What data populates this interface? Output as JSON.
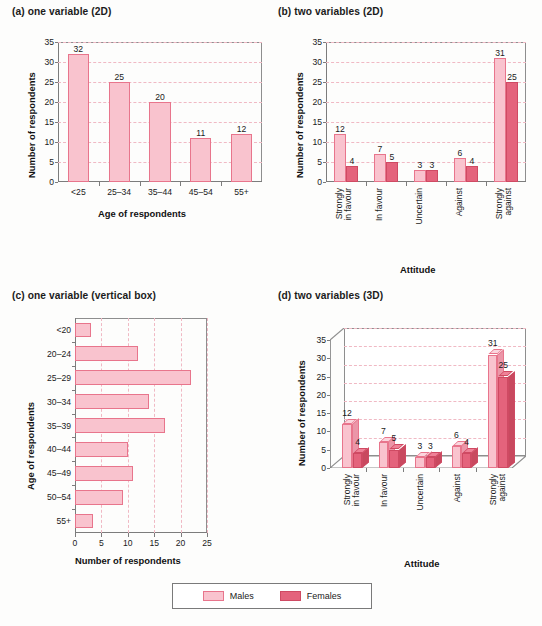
{
  "figure": {
    "panels": [
      {
        "key": "a",
        "title": "(a) one variable (2D)"
      },
      {
        "key": "b",
        "title": "(b) two variables (2D)"
      },
      {
        "key": "c",
        "title": "(c) one variable (vertical box)"
      },
      {
        "key": "d",
        "title": "(d) two variables (3D)"
      }
    ]
  },
  "legend": {
    "items": [
      {
        "label": "Males",
        "color": "#f9c3ce"
      },
      {
        "label": "Females",
        "color": "#e4637c"
      }
    ]
  },
  "colors": {
    "male_fill": "#f9c3ce",
    "male_stroke": "#e8758c",
    "female_fill": "#e4637c",
    "female_stroke": "#cf4a63",
    "gridline": "#f0b9c4",
    "axis": "#7c7c7c"
  },
  "chart_data": [
    {
      "id": "a",
      "type": "bar",
      "title": "(a) one variable (2D)",
      "xlabel": "Age of respondents",
      "ylabel": "Number of respondents",
      "categories": [
        "<25",
        "25–34",
        "35–44",
        "45–54",
        "55+"
      ],
      "values": [
        32,
        25,
        20,
        11,
        12
      ],
      "data_labels": [
        "32",
        "25",
        "20",
        "11",
        "12"
      ],
      "ylim": [
        0,
        35
      ],
      "yticks": [
        0,
        5,
        10,
        15,
        20,
        25,
        30,
        35
      ],
      "grid": "horizontal-dashed",
      "legend": "none"
    },
    {
      "id": "b",
      "type": "bar",
      "title": "(b) two variables (2D)",
      "xlabel": "Attitude",
      "ylabel": "Number of respondents",
      "categories": [
        "Strongly in favour",
        "In favour",
        "Uncertain",
        "Against",
        "Strongly against"
      ],
      "category_lines": [
        [
          "Strongly",
          "in favour"
        ],
        [
          "In favour"
        ],
        [
          "Uncertain"
        ],
        [
          "Against"
        ],
        [
          "Strongly",
          "against"
        ]
      ],
      "series": [
        {
          "name": "Males",
          "values": [
            12,
            7,
            3,
            6,
            31
          ],
          "data_labels": [
            "12",
            "7",
            "3",
            "6",
            "31"
          ]
        },
        {
          "name": "Females",
          "values": [
            4,
            5,
            3,
            4,
            25
          ],
          "data_labels": [
            "4",
            "5",
            "3",
            "4",
            "25"
          ]
        }
      ],
      "ylim": [
        0,
        35
      ],
      "yticks": [
        0,
        5,
        10,
        15,
        20,
        25,
        30,
        35
      ],
      "grid": "horizontal-dashed",
      "legend": "bottom-shared"
    },
    {
      "id": "c",
      "type": "bar",
      "orientation": "horizontal",
      "title": "(c) one variable (vertical box)",
      "xlabel": "Number of respondents",
      "ylabel": "Age of respondents",
      "categories": [
        "<20",
        "20–24",
        "25–29",
        "30–34",
        "35–39",
        "40–44",
        "45–49",
        "50–54",
        "55+"
      ],
      "values": [
        3,
        12,
        22,
        14,
        17,
        10,
        11,
        9,
        3.5
      ],
      "xlim": [
        0,
        25
      ],
      "xticks": [
        0,
        5,
        10,
        15,
        20,
        25
      ],
      "grid": "vertical-dashed",
      "legend": "none"
    },
    {
      "id": "d",
      "type": "bar",
      "render": "3d",
      "title": "(d) two variables (3D)",
      "xlabel": "Attitude",
      "ylabel": "Number of respondents",
      "categories": [
        "Strongly in favour",
        "In favour",
        "Uncertain",
        "Against",
        "Strongly against"
      ],
      "category_lines": [
        [
          "Strongly",
          "in favour"
        ],
        [
          "In favour"
        ],
        [
          "Uncertain"
        ],
        [
          "Against"
        ],
        [
          "Strongly",
          "against"
        ]
      ],
      "series": [
        {
          "name": "Males",
          "values": [
            12,
            7,
            3,
            6,
            31
          ],
          "data_labels": [
            "12",
            "7",
            "3",
            "6",
            "31"
          ]
        },
        {
          "name": "Females",
          "values": [
            4,
            5,
            3,
            4,
            25
          ],
          "data_labels": [
            "4",
            "5",
            "3",
            "4",
            "25"
          ]
        }
      ],
      "ylim": [
        0,
        35
      ],
      "yticks": [
        0,
        5,
        10,
        15,
        20,
        25,
        30,
        35
      ],
      "grid": "horizontal-dashed",
      "legend": "bottom-shared"
    }
  ]
}
